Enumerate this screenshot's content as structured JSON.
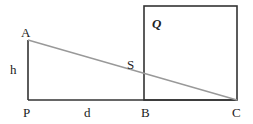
{
  "diagram": {
    "colors": {
      "line": "#333333",
      "hypotenuse": "#999999",
      "text": "#222222",
      "background": "#ffffff"
    },
    "points": {
      "A": {
        "label": "A",
        "x": 28,
        "y": 40
      },
      "P": {
        "label": "P",
        "x": 28,
        "y": 100
      },
      "B": {
        "label": "B",
        "x": 144,
        "y": 100
      },
      "C": {
        "label": "C",
        "x": 237,
        "y": 100
      },
      "S": {
        "label": "S",
        "x": 144,
        "y": 75
      }
    },
    "square": {
      "label": "Q",
      "x": 144,
      "y": 6,
      "width": 93,
      "height": 94
    },
    "lengths": {
      "h": "h",
      "d": "d"
    }
  }
}
